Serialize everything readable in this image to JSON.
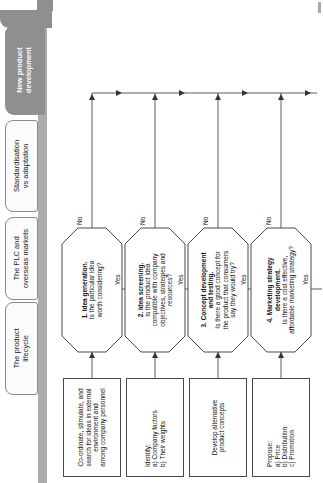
{
  "tabs": [
    {
      "label": "The product\nlifecycle",
      "active": false
    },
    {
      "label": "The PLC and\noverseas markets",
      "active": false
    },
    {
      "label": "Standardisation\nvs adaptation",
      "active": false
    },
    {
      "label": "New product\ndevelopment",
      "active": true
    }
  ],
  "flowchart": {
    "stages": [
      {
        "source": "Co-ordinate, stimulate, and\nsearch for ideas in external\nenvironment and\namong company personnel",
        "decision_title": "1. Idea generation.",
        "decision_question": "Is the particular idea\nworth considering?",
        "no_label": "No",
        "yes_label": "Yes"
      },
      {
        "source": "Identify:\na) Company factors\nb) Their weights",
        "decision_title": "2. Idea screening.",
        "decision_question": "Is the product idea\ncompatible with company\nobjectives, strategies and\nresources?",
        "no_label": "No",
        "yes_label": "Yes"
      },
      {
        "source": "Develop alternative\nproduct concepts",
        "decision_title": "3. Concept development\nand testing.",
        "decision_question": "Is there a good concept for\nthe product that consumers\nsay they would try?",
        "no_label": "No",
        "yes_label": "Yes"
      },
      {
        "source": "Propose:\na) Price\nb) Distribution\nc) Promotion",
        "decision_title": "4. Marketing strategy\ndevelopment.",
        "decision_question": "Is there a cost effective,\naffordable marketing strategy?",
        "no_label": "No",
        "yes_label": "Yes"
      }
    ]
  },
  "colors": {
    "active_tab": "#8f8f8f",
    "tab_band": "#acacac",
    "line": "#5f5f5f",
    "shape_border": "#4a4a4a",
    "arrow": "#333333"
  }
}
